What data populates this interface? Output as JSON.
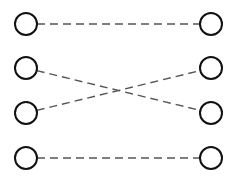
{
  "diagram": {
    "width": 227,
    "height": 191,
    "colors": {
      "background": "#ffffff",
      "node_stroke": "#111111",
      "edge_stroke": "#555555"
    },
    "node_radius": 11,
    "left_nodes": [
      {
        "id": "L1",
        "cx": 26,
        "cy": 24
      },
      {
        "id": "L2",
        "cx": 26,
        "cy": 68
      },
      {
        "id": "L3",
        "cx": 26,
        "cy": 113
      },
      {
        "id": "L4",
        "cx": 26,
        "cy": 158
      }
    ],
    "right_nodes": [
      {
        "id": "R1",
        "cx": 211,
        "cy": 24
      },
      {
        "id": "R2",
        "cx": 211,
        "cy": 68
      },
      {
        "id": "R3",
        "cx": 211,
        "cy": 113
      },
      {
        "id": "R4",
        "cx": 211,
        "cy": 158
      }
    ],
    "edges": [
      {
        "from": "L1",
        "to": "R1",
        "style": "dashed"
      },
      {
        "from": "L2",
        "to": "R3",
        "style": "dashed"
      },
      {
        "from": "L3",
        "to": "R2",
        "style": "dashed"
      },
      {
        "from": "L4",
        "to": "R4",
        "style": "dashed"
      }
    ]
  }
}
